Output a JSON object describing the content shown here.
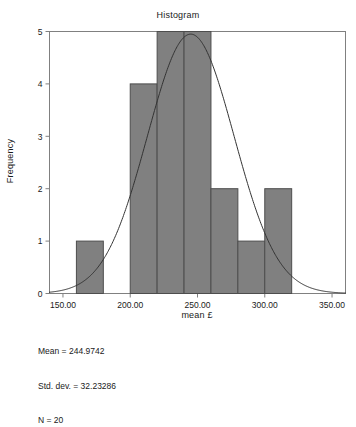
{
  "chart_data": {
    "type": "bar",
    "title": "Histogram",
    "xlabel": "mean £",
    "ylabel": "Frequency",
    "xlim": [
      140,
      360
    ],
    "ylim": [
      0,
      5
    ],
    "grid": false,
    "legend": "none",
    "bin_width": 20,
    "bin_edges": [
      160,
      180,
      200,
      220,
      240,
      260,
      280,
      300,
      320
    ],
    "categories": [
      "160-180",
      "180-200",
      "200-220",
      "220-240",
      "240-260",
      "260-280",
      "280-300",
      "300-320"
    ],
    "values": [
      1,
      0,
      4,
      5,
      5,
      2,
      1,
      2
    ],
    "bars": [
      {
        "start": 160,
        "end": 180,
        "frequency": 1
      },
      {
        "start": 200,
        "end": 220,
        "frequency": 4
      },
      {
        "start": 220,
        "end": 240,
        "frequency": 5
      },
      {
        "start": 240,
        "end": 260,
        "frequency": 5
      },
      {
        "start": 260,
        "end": 280,
        "frequency": 2
      },
      {
        "start": 280,
        "end": 300,
        "frequency": 1
      },
      {
        "start": 300,
        "end": 320,
        "frequency": 2
      }
    ],
    "xticks": [
      150,
      200,
      250,
      300,
      350
    ],
    "xtick_labels": [
      "150.00",
      "200.00",
      "250.00",
      "300.00",
      "350.00"
    ],
    "yticks": [
      0,
      1,
      2,
      3,
      4,
      5
    ],
    "ytick_labels": [
      "0",
      "1",
      "2",
      "3",
      "4",
      "5"
    ],
    "overlay_curve": {
      "type": "normal",
      "mean": 244.9742,
      "std_dev": 32.23286,
      "n": 20,
      "peak_frequency": 4.95
    },
    "annotations": {
      "mean": "Mean = 244.9742",
      "std_dev": "Std. dev. = 32.23286",
      "n": "N = 20"
    }
  },
  "colors": {
    "bar_fill": "#808080",
    "bar_stroke": "#4d4d4d",
    "curve": "#333333",
    "axis": "#808080",
    "text": "#1a1a1a",
    "background": "#ffffff"
  }
}
